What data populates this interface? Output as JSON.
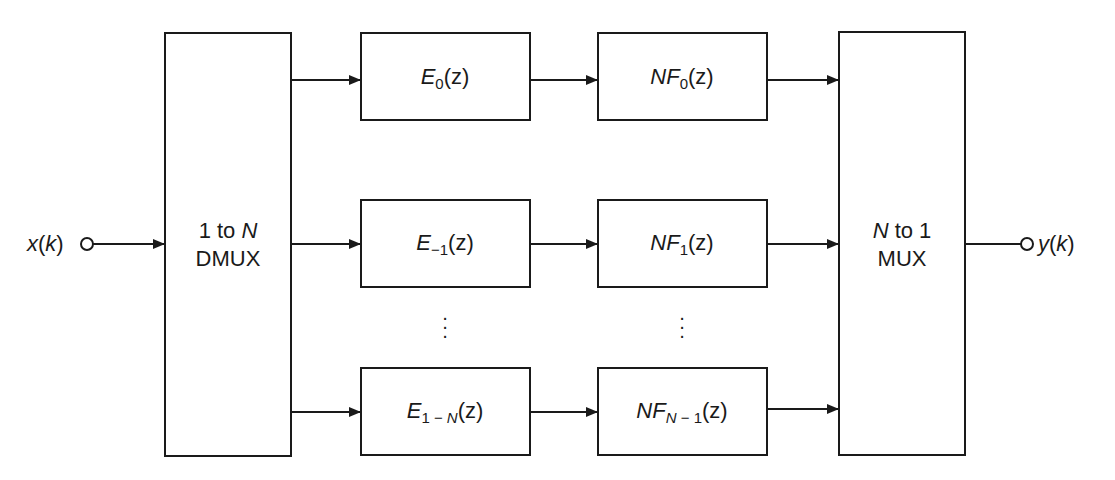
{
  "diagram": {
    "input": {
      "label_var": "x",
      "label_arg": "k"
    },
    "output": {
      "label_var": "y",
      "label_arg": "k"
    },
    "dmux": {
      "line1_prefix": "1 to ",
      "line1_var": "N",
      "line2": "DMUX"
    },
    "mux": {
      "line1_var": "N",
      "line1_suffix": " to 1",
      "line2": "MUX"
    },
    "branches": [
      {
        "e_sym": "E",
        "e_sub": "0",
        "nf_sym": "NF",
        "nf_sub": "0",
        "arg": "(z)"
      },
      {
        "e_sym": "E",
        "e_sub": "−1",
        "nf_sym": "NF",
        "nf_sub": "1",
        "arg": "(z)"
      },
      {
        "e_sym": "E",
        "e_sub_pre": "1 − ",
        "e_sub_var": "N",
        "nf_sym": "NF",
        "nf_sub_var": "N",
        "nf_sub_post": " − 1",
        "arg": "(z)"
      }
    ],
    "ellipsis": "⋮",
    "colors": {
      "stroke": "#1a1a1a",
      "background": "#ffffff"
    }
  }
}
